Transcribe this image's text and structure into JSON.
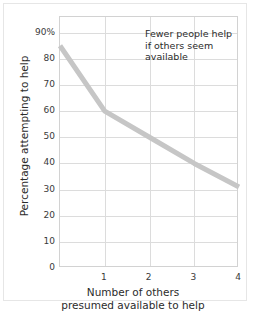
{
  "chart_data": {
    "type": "line",
    "title": "",
    "subtitle": "",
    "xlabel_lines": [
      "Number of others",
      "presumed available to help"
    ],
    "ylabel": "Percentage attempting to help",
    "x": [
      0,
      1,
      2,
      3,
      4
    ],
    "values": [
      85,
      60,
      50,
      40,
      31
    ],
    "series": [
      {
        "name": "Percentage attempting to help",
        "values": [
          85,
          60,
          50,
          40,
          31
        ],
        "color": "#c6c6c6"
      }
    ],
    "xlim": [
      0,
      4
    ],
    "ylim": [
      0,
      96
    ],
    "xticks": [
      0,
      1,
      2,
      3,
      4
    ],
    "xticklabels": [
      "",
      "1",
      "2",
      "3",
      "4"
    ],
    "yticks": [
      0,
      10,
      20,
      30,
      40,
      50,
      60,
      70,
      80,
      90
    ],
    "yticklabels": [
      "0",
      "10",
      "20",
      "30",
      "40",
      "50",
      "60",
      "70",
      "80",
      "90%"
    ],
    "grid": true,
    "grid_color": "#dcdcdc",
    "legend": false,
    "legend_position": "none",
    "annotations": [
      {
        "name": "fewer-people-help-note",
        "lines": [
          "Fewer people help",
          "if others seem",
          "available"
        ],
        "x": 1.95,
        "y": 92
      }
    ],
    "plot_background": "#ffffff",
    "axis_color": "#d2d2d2",
    "text_color": "#2b2b2b"
  }
}
